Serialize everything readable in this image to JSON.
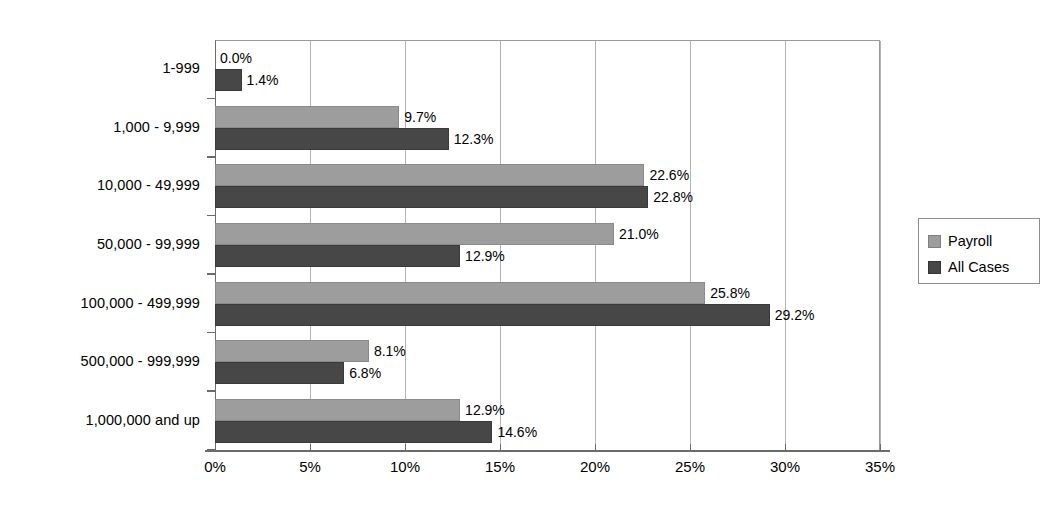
{
  "chart_data": {
    "type": "bar",
    "orientation": "horizontal",
    "title": "",
    "subtitle": "",
    "xlabel": "",
    "ylabel": "",
    "xlim": [
      0,
      35
    ],
    "xtick_labels": [
      "0%",
      "5%",
      "10%",
      "15%",
      "20%",
      "25%",
      "30%",
      "35%"
    ],
    "xtick_values": [
      0,
      5,
      10,
      15,
      20,
      25,
      30,
      35
    ],
    "grid": true,
    "grid_axis": "x",
    "legend_position": "right",
    "categories": [
      "1-999",
      "1,000 - 9,999",
      "10,000 - 49,999",
      "50,000 - 99,999",
      "100,000 - 499,999",
      "500,000 - 999,999",
      "1,000,000 and up"
    ],
    "series": [
      {
        "name": "Payroll",
        "color": "#9d9d9d",
        "values": [
          0.0,
          9.7,
          22.6,
          21.0,
          25.8,
          8.1,
          12.9
        ],
        "labels": [
          "0.0%",
          "9.7%",
          "22.6%",
          "21.0%",
          "25.8%",
          "8.1%",
          "12.9%"
        ]
      },
      {
        "name": "All Cases",
        "color": "#474747",
        "values": [
          1.4,
          12.3,
          22.8,
          12.9,
          29.2,
          6.8,
          14.6
        ],
        "labels": [
          "1.4%",
          "12.3%",
          "22.8%",
          "12.9%",
          "29.2%",
          "6.8%",
          "14.6%"
        ]
      }
    ]
  },
  "legend": {
    "entries": [
      {
        "label": "Payroll"
      },
      {
        "label": "All Cases"
      }
    ]
  }
}
